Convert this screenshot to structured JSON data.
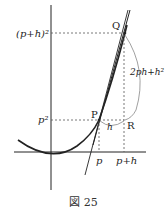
{
  "figure": {
    "caption": "図 25",
    "labels": {
      "y_top": "(p+h)²",
      "y_mid": "p²",
      "point_q": "Q",
      "point_p": "P",
      "point_r": "R",
      "h_label": "h",
      "rise_label": "2ph+h²",
      "x_p": "p",
      "x_ph": "p+h"
    },
    "colors": {
      "ink": "#222222",
      "dash": "#555555",
      "background": "#ffffff"
    }
  }
}
